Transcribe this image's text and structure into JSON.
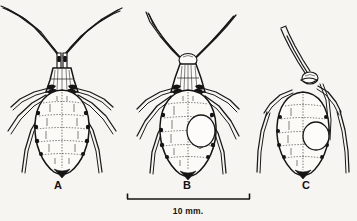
{
  "figure": {
    "kind": "scientific-line-drawing",
    "background_color": "#f7f5f1",
    "ink_color": "#161616",
    "panel_labels": [
      {
        "id": "A",
        "label": "A",
        "label_x": 58,
        "label_y": 189
      },
      {
        "id": "B",
        "label": "B",
        "label_x": 187,
        "label_y": 189
      },
      {
        "id": "C",
        "label": "C",
        "label_x": 306,
        "label_y": 189
      }
    ],
    "scale_bar": {
      "label": "10 mm.",
      "x_start": 127,
      "x_end": 250,
      "y": 199,
      "tick_height": 6,
      "label_x": 188,
      "label_y": 214
    },
    "specimens": [
      {
        "id": "A",
        "label": "A",
        "description": "alate-form aphid, dorsal view, long V-spread antennae, six legs, segmented oval abdomen",
        "antennae_count": 2,
        "legs_count": 6,
        "has_abdominal_spot": false,
        "body_center_x": 60,
        "body_center_y": 120
      },
      {
        "id": "B",
        "label": "B",
        "description": "aphid dorsal view with pale oval marking on right abdomen, long antennae, six legs",
        "antennae_count": 2,
        "legs_count": 6,
        "has_abdominal_spot": true,
        "body_center_x": 188,
        "body_center_y": 122
      },
      {
        "id": "C",
        "label": "C",
        "description": "smaller aphid, dorsal view, single thick antenna directed up-left, pale oval marking on right abdomen",
        "antennae_count": 1,
        "legs_count": 4,
        "has_abdominal_spot": true,
        "body_center_x": 303,
        "body_center_y": 130
      }
    ]
  }
}
